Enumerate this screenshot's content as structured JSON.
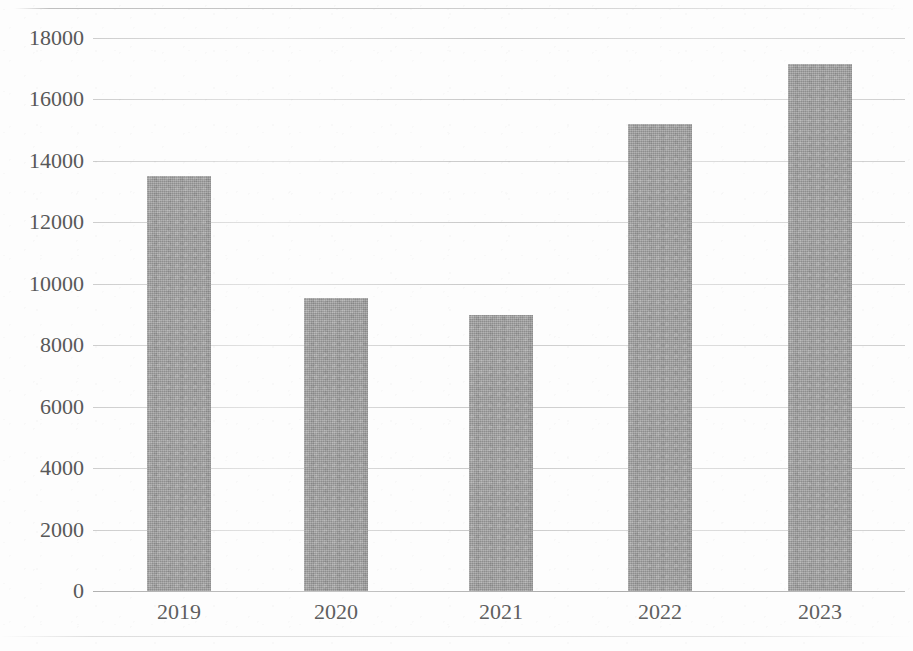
{
  "chart_data": {
    "type": "bar",
    "title": "",
    "subtitle": "",
    "xlabel": "",
    "ylabel": "",
    "categories": [
      "2019",
      "2020",
      "2021",
      "2022",
      "2023"
    ],
    "values": [
      13500,
      9550,
      9000,
      15200,
      17150
    ],
    "series": [
      {
        "name": "",
        "values": [
          13500,
          9550,
          9000,
          15200,
          17150
        ]
      }
    ],
    "ylim": [
      0,
      18000
    ],
    "y_ticks": [
      0,
      2000,
      4000,
      6000,
      8000,
      10000,
      12000,
      14000,
      16000,
      18000
    ],
    "y_tick_labels": [
      "0",
      "2000",
      "4000",
      "6000",
      "8000",
      "10000",
      "12000",
      "14000",
      "16000",
      "18000"
    ],
    "x_tick_labels": [
      "2019",
      "2020",
      "2021",
      "2022",
      "2023"
    ],
    "grid": true,
    "grid_axis": "y",
    "legend": false,
    "legend_position": "none",
    "annotations": [],
    "data_labels": false,
    "colors": {
      "bar_fill": "#a2a2a2",
      "gridline": "#c0c0c0",
      "axis_line": "#a8a8a8",
      "tick_label": "#585858",
      "background": "#fdfdfd"
    }
  }
}
